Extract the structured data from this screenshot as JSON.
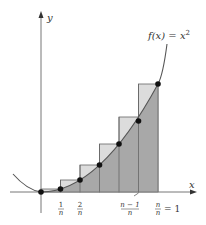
{
  "diagram": {
    "curve_label": "f(x) = x²",
    "curve_label_parts": {
      "f": "f(x) = x",
      "exp": "2"
    },
    "axes": {
      "x_label": "x",
      "y_label": "y"
    },
    "n_rectangles": 6,
    "tick_labels": [
      {
        "num": "1",
        "den": "n"
      },
      {
        "num": "2",
        "den": "n"
      },
      {
        "num": "n − 1",
        "den": "n"
      },
      {
        "num": "n",
        "den": "n",
        "suffix": "= 1"
      }
    ],
    "colors": {
      "under_curve_fill": "#a8a8a8",
      "over_curve_fill": "#dcdcdc",
      "curve": "#555555",
      "axis": "#777777",
      "points": "#111111"
    }
  }
}
